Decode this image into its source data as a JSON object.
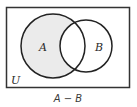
{
  "diagram": {
    "type": "venn",
    "universe_label": "U",
    "sets": [
      {
        "label": "A",
        "cx": 53,
        "cy": 46,
        "r": 32,
        "shaded_part": "only A (A minus B)"
      },
      {
        "label": "B",
        "cx": 86,
        "cy": 46,
        "r": 26,
        "shaded_part": "none"
      }
    ],
    "shaded_region": "A − B",
    "caption": "A − B",
    "colors": {
      "shade": "#ebebeb",
      "stroke": "#222222",
      "background": "#ffffff"
    }
  }
}
